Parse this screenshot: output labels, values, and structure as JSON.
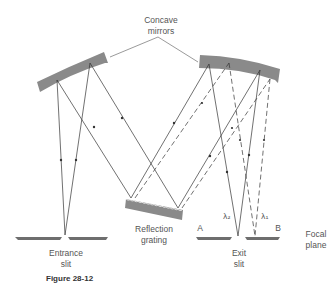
{
  "diagram": {
    "labels": {
      "concave_mirrors": "Concave\nmirrors",
      "reflection_grating": "Reflection\ngrating",
      "entrance_slit": "Entrance\nslit",
      "exit_slit": "Exit\nslit",
      "focal_plane": "Focal\nplane",
      "point_a": "A",
      "point_b": "B",
      "lambda_2": "λ₂",
      "lambda_1": "λ₁"
    },
    "caption": "Figure 28-12",
    "colors": {
      "component_fill": "#8a8a8a",
      "ray_line": "#333333",
      "label_text": "#555555"
    },
    "components": [
      {
        "id": "left-concave-mirror",
        "type": "concave mirror"
      },
      {
        "id": "right-concave-mirror",
        "type": "concave mirror"
      },
      {
        "id": "reflection-grating",
        "type": "grating"
      },
      {
        "id": "entrance-slit",
        "type": "slit"
      },
      {
        "id": "exit-slit",
        "type": "slit"
      }
    ],
    "rays": {
      "solid": "λ₂ path",
      "dashed": "λ₁ path"
    }
  }
}
